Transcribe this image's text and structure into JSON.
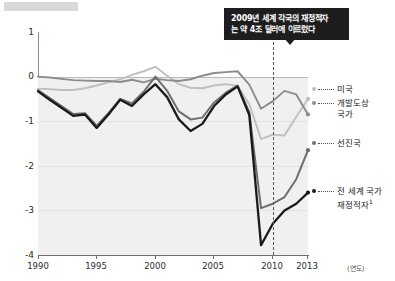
{
  "chart_data": {
    "type": "line",
    "title": "",
    "xlabel": "(연도)",
    "ylabel": "",
    "xlim": [
      1990,
      2013
    ],
    "ylim": [
      -4,
      1
    ],
    "grid": true,
    "legend_position": "right",
    "xticks": [
      "1990",
      "1995",
      "2000",
      "2005",
      "2010",
      "2013"
    ],
    "yticks": [
      "1",
      "0",
      "-1",
      "-2",
      "-3",
      "-4"
    ],
    "x": [
      1990,
      1991,
      1992,
      1993,
      1994,
      1995,
      1996,
      1997,
      1998,
      1999,
      2000,
      2001,
      2002,
      2003,
      2004,
      2005,
      2006,
      2007,
      2008,
      2009,
      2010,
      2011,
      2012,
      2013
    ],
    "series": [
      {
        "name": "미국",
        "color": "#bfbfbf",
        "values": [
          -0.27,
          -0.28,
          -0.3,
          -0.3,
          -0.26,
          -0.2,
          -0.13,
          -0.06,
          0.04,
          0.12,
          0.22,
          0.02,
          -0.17,
          -0.25,
          -0.26,
          -0.2,
          -0.17,
          -0.21,
          -0.62,
          -1.4,
          -1.3,
          -1.32,
          -0.9,
          -0.5
        ]
      },
      {
        "name": "개발도상 국가",
        "color": "#8c8c8c",
        "values": [
          0.0,
          -0.02,
          -0.05,
          -0.08,
          -0.09,
          -0.1,
          -0.1,
          -0.12,
          -0.07,
          -0.13,
          -0.05,
          -0.08,
          -0.1,
          -0.06,
          0.02,
          0.08,
          0.1,
          0.12,
          -0.18,
          -0.72,
          -0.55,
          -0.32,
          -0.4,
          -0.85
        ]
      },
      {
        "name": "선진국",
        "color": "#6e6e6e",
        "values": [
          -0.3,
          -0.48,
          -0.66,
          -0.84,
          -0.82,
          -1.1,
          -0.82,
          -0.5,
          -0.6,
          -0.34,
          0.0,
          -0.32,
          -0.78,
          -0.96,
          -0.92,
          -0.58,
          -0.36,
          -0.2,
          -0.8,
          -2.95,
          -2.85,
          -2.7,
          -2.3,
          -1.65
        ]
      },
      {
        "name": "전 세계 국가 재정적자",
        "color": "#1a1a1a",
        "values": [
          -0.33,
          -0.52,
          -0.7,
          -0.88,
          -0.85,
          -1.15,
          -0.85,
          -0.52,
          -0.66,
          -0.4,
          -0.17,
          -0.46,
          -0.96,
          -1.22,
          -1.06,
          -0.66,
          -0.4,
          -0.22,
          -0.86,
          -3.78,
          -3.3,
          -3.0,
          -2.85,
          -2.6
        ]
      }
    ],
    "annotation": {
      "line1": "2009년 세계 각국의 재정적자",
      "line2": "는 약 4조 달러에 이르렀다",
      "marker_year": "2010"
    }
  },
  "legend": {
    "items": [
      {
        "label": "미국",
        "label2": "",
        "color": "#bfbfbf"
      },
      {
        "label": "개발도상",
        "label2": "국가",
        "color": "#8c8c8c"
      },
      {
        "label": "선진국",
        "label2": "",
        "color": "#6e6e6e"
      },
      {
        "label": "전 세계 국가",
        "label2": "재정적자",
        "footnote": "1",
        "color": "#1a1a1a"
      }
    ]
  }
}
